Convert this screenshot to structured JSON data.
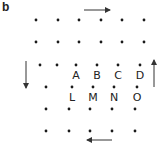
{
  "panel_label": "b",
  "colors": {
    "dot": "#1a1a1a",
    "arrow": "#333333",
    "text": "#222222"
  },
  "grid": {
    "rows": [
      {
        "y": 20,
        "xs": [
          36,
          58,
          79,
          101,
          122,
          144
        ]
      },
      {
        "y": 42,
        "xs": [
          36,
          58,
          79,
          101,
          122,
          144
        ]
      },
      {
        "y": 65,
        "xs": [
          40,
          57,
          76,
          97,
          118,
          140
        ]
      },
      {
        "y": 87,
        "xs": [
          46,
          72,
          93,
          114,
          137
        ]
      },
      {
        "y": 109,
        "xs": [
          46,
          69,
          90,
          112,
          135
        ]
      },
      {
        "y": 131,
        "xs": [
          46,
          69,
          90,
          112,
          135
        ]
      }
    ]
  },
  "labels": [
    {
      "text": "A",
      "x": 76,
      "y": 79
    },
    {
      "text": "B",
      "x": 97,
      "y": 79
    },
    {
      "text": "C",
      "x": 118,
      "y": 79
    },
    {
      "text": "D",
      "x": 140,
      "y": 79
    },
    {
      "text": "L",
      "x": 72,
      "y": 101
    },
    {
      "text": "M",
      "x": 93,
      "y": 101
    },
    {
      "text": "N",
      "x": 114,
      "y": 101
    },
    {
      "text": "O",
      "x": 137,
      "y": 101
    }
  ],
  "arrows": [
    {
      "name": "arrow-right",
      "x1": 84,
      "y1": 10,
      "x2": 110,
      "y2": 10
    },
    {
      "name": "arrow-down",
      "x1": 26,
      "y1": 61,
      "x2": 26,
      "y2": 88
    },
    {
      "name": "arrow-up",
      "x1": 154,
      "y1": 87,
      "x2": 154,
      "y2": 60
    },
    {
      "name": "arrow-left",
      "x1": 112,
      "y1": 140,
      "x2": 87,
      "y2": 140
    }
  ]
}
